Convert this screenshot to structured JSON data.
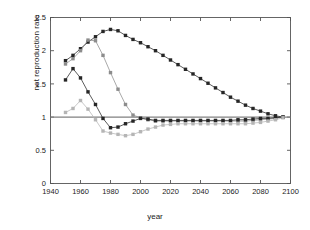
{
  "chart_data": {
    "type": "line",
    "title": "",
    "xlabel": "year",
    "ylabel": "net reproduction rate",
    "xlim": [
      1940,
      2100
    ],
    "ylim": [
      0,
      2.5
    ],
    "xticks": [
      1940,
      1960,
      1980,
      2000,
      2020,
      2040,
      2060,
      2080,
      2100
    ],
    "yticks": [
      0,
      0.5,
      1,
      1.5,
      2,
      2.5
    ],
    "xticklabels": [
      "1940",
      "1960",
      "1980",
      "2000",
      "2020",
      "2040",
      "2060",
      "2080",
      "2100"
    ],
    "yticklabels": [
      "0",
      "0.5",
      "1",
      "1.5",
      "2",
      "2.5"
    ],
    "grid": false,
    "legend": "none",
    "marker": "square",
    "reference_lines": [
      {
        "name": "replacement-level",
        "axis": "y",
        "value": 1.0,
        "color": "#808080"
      }
    ],
    "series": [
      {
        "name": "series-1-dark",
        "color": "#262626",
        "x": [
          1950,
          1955,
          1960,
          1965,
          1970,
          1975,
          1980,
          1985,
          1990,
          1995,
          2000,
          2005,
          2010,
          2015,
          2020,
          2025,
          2030,
          2035,
          2040,
          2045,
          2050,
          2055,
          2060,
          2065,
          2070,
          2075,
          2080,
          2085,
          2090,
          2095
        ],
        "values": [
          1.85,
          1.93,
          2.03,
          2.13,
          2.21,
          2.29,
          2.32,
          2.3,
          2.23,
          2.17,
          2.12,
          2.06,
          2.0,
          1.93,
          1.86,
          1.79,
          1.72,
          1.65,
          1.58,
          1.51,
          1.44,
          1.37,
          1.3,
          1.24,
          1.18,
          1.13,
          1.09,
          1.05,
          1.02,
          1.0
        ]
      },
      {
        "name": "series-2-mid-gray",
        "color": "#8c8c8c",
        "x": [
          1950,
          1955,
          1960,
          1965,
          1970,
          1975,
          1980,
          1985,
          1990,
          1995,
          2000,
          2005,
          2010,
          2015,
          2020,
          2025,
          2030,
          2035,
          2040,
          2045,
          2050,
          2055,
          2060,
          2065,
          2070,
          2075,
          2080,
          2085,
          2090,
          2095
        ],
        "values": [
          1.8,
          1.88,
          2.0,
          2.16,
          2.15,
          1.93,
          1.67,
          1.42,
          1.19,
          1.03,
          0.99,
          0.96,
          0.94,
          0.94,
          0.94,
          0.94,
          0.94,
          0.94,
          0.94,
          0.94,
          0.94,
          0.94,
          0.94,
          0.94,
          0.94,
          0.95,
          0.96,
          0.97,
          0.98,
          1.0
        ]
      },
      {
        "name": "series-3-dark-declining",
        "color": "#262626",
        "x": [
          1950,
          1955,
          1960,
          1965,
          1970,
          1975,
          1980,
          1985,
          1990,
          1995,
          2000,
          2005,
          2010,
          2015,
          2020,
          2025,
          2030,
          2035,
          2040,
          2045,
          2050,
          2055,
          2060,
          2065,
          2070,
          2075,
          2080,
          2085,
          2090,
          2095
        ],
        "values": [
          1.56,
          1.73,
          1.59,
          1.38,
          1.19,
          0.98,
          0.84,
          0.85,
          0.9,
          0.94,
          0.98,
          0.97,
          0.95,
          0.95,
          0.95,
          0.95,
          0.95,
          0.95,
          0.95,
          0.95,
          0.95,
          0.95,
          0.95,
          0.96,
          0.96,
          0.97,
          0.98,
          0.98,
          0.99,
          1.0
        ]
      },
      {
        "name": "series-4-light-gray",
        "color": "#b5b5b5",
        "x": [
          1950,
          1955,
          1960,
          1965,
          1970,
          1975,
          1980,
          1985,
          1990,
          1995,
          2000,
          2005,
          2010,
          2015,
          2020,
          2025,
          2030,
          2035,
          2040,
          2045,
          2050,
          2055,
          2060,
          2065,
          2070,
          2075,
          2080,
          2085,
          2090,
          2095
        ],
        "values": [
          1.07,
          1.13,
          1.25,
          1.12,
          0.96,
          0.79,
          0.76,
          0.74,
          0.72,
          0.74,
          0.78,
          0.82,
          0.85,
          0.88,
          0.89,
          0.9,
          0.9,
          0.9,
          0.9,
          0.9,
          0.9,
          0.9,
          0.9,
          0.9,
          0.9,
          0.91,
          0.92,
          0.94,
          0.96,
          0.99
        ]
      }
    ]
  },
  "axes": {
    "frame_color": "#555555",
    "tick_color": "#555555",
    "background": "#ffffff"
  }
}
